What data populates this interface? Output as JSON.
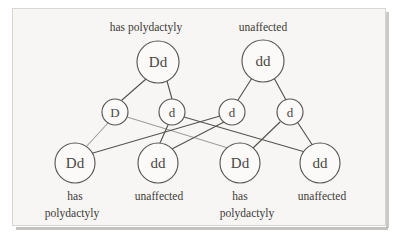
{
  "figure": {
    "background_color": "#f7f6f4",
    "line_color": "#56534f",
    "text_color": "#3c3936"
  },
  "parents": [
    {
      "id": "parent-left",
      "genotype": "Dd",
      "phenotype": "has polydactyly",
      "cx": 158,
      "cy": 62,
      "r": 21
    },
    {
      "id": "parent-right",
      "genotype": "dd",
      "phenotype": "unaffected",
      "cx": 263,
      "cy": 61,
      "r": 21
    }
  ],
  "gametes": [
    {
      "id": "gamete-1",
      "allele": "D",
      "cx": 115,
      "cy": 112,
      "r": 13
    },
    {
      "id": "gamete-2",
      "allele": "d",
      "cx": 172,
      "cy": 112,
      "r": 13
    },
    {
      "id": "gamete-3",
      "allele": "d",
      "cx": 232,
      "cy": 112,
      "r": 13
    },
    {
      "id": "gamete-4",
      "allele": "d",
      "cx": 290,
      "cy": 112,
      "r": 13
    }
  ],
  "offspring": [
    {
      "id": "offspring-1",
      "genotype": "Dd",
      "phenotype_line1": "has",
      "phenotype_line2": "polydactyly",
      "cx": 75,
      "cy": 163,
      "r": 20
    },
    {
      "id": "offspring-2",
      "genotype": "dd",
      "phenotype_line1": "unaffected",
      "phenotype_line2": "",
      "cx": 158,
      "cy": 163,
      "r": 20
    },
    {
      "id": "offspring-3",
      "genotype": "Dd",
      "phenotype_line1": "has",
      "phenotype_line2": "polydactyly",
      "cx": 240,
      "cy": 163,
      "r": 20
    },
    {
      "id": "offspring-4",
      "genotype": "dd",
      "phenotype_line1": "unaffected",
      "phenotype_line2": "",
      "cx": 320,
      "cy": 163,
      "r": 20
    }
  ],
  "labels": {
    "parent_left_phenotype": "has polydactyly",
    "parent_right_phenotype": "unaffected",
    "offspring_1_line1": "has",
    "offspring_1_line2": "polydactyly",
    "offspring_2_line1": "unaffected",
    "offspring_3_line1": "has",
    "offspring_3_line2": "polydactyly",
    "offspring_4_line1": "unaffected"
  },
  "alleles": {
    "parent_left_genotype": "Dd",
    "parent_right_genotype": "dd",
    "gamete_1": "D",
    "gamete_2": "d",
    "gamete_3": "d",
    "gamete_4": "d",
    "offspring_1_genotype": "Dd",
    "offspring_2_genotype": "dd",
    "offspring_3_genotype": "Dd",
    "offspring_4_genotype": "dd"
  }
}
